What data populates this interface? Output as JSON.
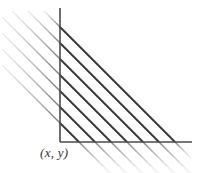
{
  "figure": {
    "type": "line-diagram",
    "background_color": "#ffffff",
    "width": 200,
    "height": 173,
    "labels": {
      "corner_point": "(x, y)"
    },
    "axes": {
      "origin": {
        "x": 60,
        "y": 142
      },
      "vertical": {
        "name": "vertical-axis",
        "x": 60,
        "y_top": 8,
        "y_bottom": 142,
        "color": "#4a4a4a",
        "width": 1.6
      },
      "horizontal": {
        "name": "horizontal-axis",
        "y": 142,
        "x_left": 60,
        "x_right": 192,
        "color": "#4a4a4a",
        "width": 1.6
      }
    },
    "level_lines": {
      "slope": -1,
      "count": 7,
      "spacing": 16,
      "dark_color": "#3a3a3a",
      "dark_width": 1.9,
      "segments": [
        {
          "id": 1,
          "y_intercept": 27,
          "x_intercept": 175,
          "opacity": 1.0
        },
        {
          "id": 2,
          "y_intercept": 43,
          "x_intercept": 159,
          "opacity": 1.0
        },
        {
          "id": 3,
          "y_intercept": 59,
          "x_intercept": 143,
          "opacity": 1.0
        },
        {
          "id": 4,
          "y_intercept": 75,
          "x_intercept": 127,
          "opacity": 1.0
        },
        {
          "id": 5,
          "y_intercept": 91,
          "x_intercept": 111,
          "opacity": 1.0
        },
        {
          "id": 6,
          "y_intercept": 107,
          "x_intercept": 95,
          "opacity": 1.0
        },
        {
          "id": 7,
          "y_intercept": 123,
          "x_intercept": 79,
          "opacity": 1.0
        }
      ],
      "faded_color": "#8a8a8a",
      "faded_width": 1.3,
      "extensions": [
        {
          "id": 1,
          "left_x": 44,
          "left_y": 11,
          "below_x": 191,
          "below_y": 158,
          "fade_left": 0.0,
          "fade_right": 0.65
        },
        {
          "id": 2,
          "left_x": 28,
          "left_y": 11,
          "below_x": 190,
          "below_y": 173,
          "fade_left": 0.15,
          "fade_right": 0.6
        },
        {
          "id": 3,
          "left_x": 12,
          "left_y": 11,
          "below_x": 174,
          "below_y": 173,
          "fade_left": 0.3,
          "fade_right": 0.55
        },
        {
          "id": 4,
          "left_x": 2,
          "left_y": 17,
          "below_x": 158,
          "below_y": 173,
          "fade_left": 0.45,
          "fade_right": 0.5
        },
        {
          "id": 5,
          "left_x": 2,
          "left_y": 33,
          "below_x": 142,
          "below_y": 173,
          "fade_left": 0.5,
          "fade_right": 0.45
        },
        {
          "id": 6,
          "left_x": 2,
          "left_y": 49,
          "below_x": 126,
          "below_y": 173,
          "fade_left": 0.5,
          "fade_right": 0.4
        },
        {
          "id": 7,
          "left_x": 2,
          "left_y": 65,
          "below_x": 110,
          "below_y": 173,
          "fade_left": 0.5,
          "fade_right": 0.35
        }
      ]
    }
  }
}
